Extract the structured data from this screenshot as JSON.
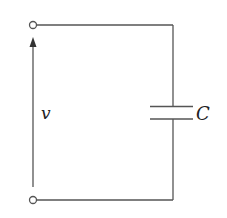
{
  "diagram": {
    "type": "circuit",
    "colors": {
      "wire": "#555555",
      "text": "#222222",
      "background": "#ffffff"
    },
    "labels": {
      "voltage": "v",
      "capacitor": "C"
    },
    "components": [
      {
        "id": "terminal-top",
        "kind": "terminal"
      },
      {
        "id": "terminal-bottom",
        "kind": "terminal"
      },
      {
        "id": "capacitor",
        "kind": "capacitor",
        "label": "C"
      },
      {
        "id": "voltage-arrow",
        "kind": "voltage-reference-arrow",
        "label": "v",
        "direction": "up"
      }
    ]
  }
}
